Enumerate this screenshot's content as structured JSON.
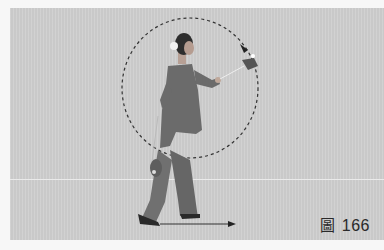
{
  "figure": {
    "caption_glyph": "圖",
    "caption_number": "166"
  },
  "colors": {
    "background": "#cfcfcf",
    "page": "#f7f7f7",
    "figure_garment": "#6e6e6e",
    "path_line": "#333333"
  },
  "annotations": {
    "circle_path": "dashed circular trajectory with arrowhead",
    "ground_arrow": "horizontal arrow indicating forward step direction"
  }
}
